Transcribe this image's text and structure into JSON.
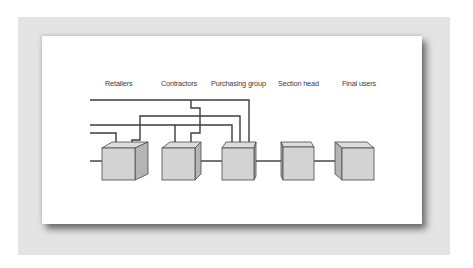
{
  "diagram": {
    "type": "supply-chain-flow",
    "nodes": [
      {
        "id": "retailers",
        "label": "Retailers"
      },
      {
        "id": "contractors",
        "label": "Contractors"
      },
      {
        "id": "purchasing_group",
        "label": "Purchasing group"
      },
      {
        "id": "section_head",
        "label": "Section head"
      },
      {
        "id": "final_users",
        "label": "Final users"
      }
    ],
    "edges": [
      {
        "from": "retailers",
        "to": "contractors"
      },
      {
        "from": "contractors",
        "to": "purchasing_group"
      },
      {
        "from": "purchasing_group",
        "to": "section_head"
      },
      {
        "from": "section_head",
        "to": "final_users"
      },
      {
        "from": "external-1",
        "to": "purchasing_group"
      },
      {
        "from": "external-1",
        "to": "contractors"
      },
      {
        "from": "external-2",
        "to": "purchasing_group"
      },
      {
        "from": "external-2",
        "to": "contractors"
      },
      {
        "from": "external-3",
        "to": "retailers"
      },
      {
        "from": "retailers",
        "to": "purchasing_group"
      }
    ],
    "colors": {
      "box_front": "#d3d3d3",
      "box_side": "#b4b4b4",
      "line": "#3c3c3c",
      "panel": "#e4e4e4",
      "card": "#ffffff"
    }
  }
}
